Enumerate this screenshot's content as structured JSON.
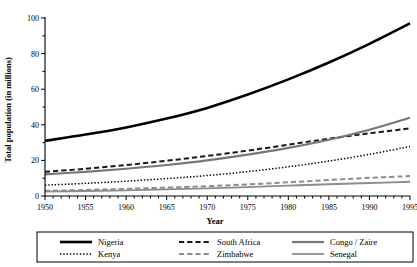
{
  "chart_data": {
    "type": "line",
    "title": "",
    "xlabel": "Year",
    "ylabel": "Total population (in millions)",
    "xlim": [
      1950,
      1995
    ],
    "ylim": [
      0,
      100
    ],
    "xticks": [
      1950,
      1955,
      1960,
      1965,
      1970,
      1975,
      1980,
      1985,
      1990,
      1995
    ],
    "xticklabels": [
      "1950",
      "1955",
      "1960",
      "1965",
      "1970",
      "1975",
      "1980",
      "1985",
      "1990",
      "1995"
    ],
    "x_minor_step": 1,
    "yticks": [
      0,
      20,
      40,
      60,
      80,
      100
    ],
    "yticklabels": [
      "0",
      "20",
      "40",
      "60",
      "80",
      "100"
    ],
    "y_minor_step": 10,
    "grid": false,
    "legend_position": "bottom",
    "legend_columns": 3,
    "x": [
      1950,
      1955,
      1960,
      1965,
      1970,
      1975,
      1980,
      1985,
      1990,
      1995
    ],
    "series": [
      {
        "name": "Nigeria",
        "color": "#000000",
        "style": "solid",
        "width": 2.6,
        "legend_col": 0,
        "legend_row": 0,
        "values": [
          31.0,
          34.5,
          38.5,
          43.5,
          49.5,
          57.0,
          65.5,
          75.0,
          85.5,
          97.0
        ]
      },
      {
        "name": "Kenya",
        "color": "#000000",
        "style": "dotted",
        "width": 1.5,
        "legend_col": 0,
        "legend_row": 1,
        "values": [
          6.1,
          7.1,
          8.3,
          9.8,
          11.5,
          13.7,
          16.4,
          19.6,
          23.4,
          27.8
        ]
      },
      {
        "name": "South Africa",
        "color": "#1a1a1a",
        "style": "dashed",
        "width": 2.0,
        "legend_col": 1,
        "legend_row": 0,
        "values": [
          13.6,
          15.3,
          17.4,
          19.8,
          22.5,
          25.5,
          28.8,
          32.2,
          35.2,
          38.0
        ]
      },
      {
        "name": "Zimbabwe",
        "color": "#8c8c8c",
        "style": "dashed",
        "width": 2.0,
        "legend_col": 1,
        "legend_row": 1,
        "values": [
          2.9,
          3.4,
          4.0,
          4.7,
          5.5,
          6.5,
          7.7,
          9.0,
          10.2,
          11.2
        ]
      },
      {
        "name": "Congo / Zaire",
        "color": "#777777",
        "style": "solid",
        "width": 2.2,
        "legend_col": 2,
        "legend_row": 0,
        "values": [
          12.2,
          13.6,
          15.3,
          17.4,
          20.0,
          23.2,
          27.0,
          31.6,
          37.2,
          44.0
        ]
      },
      {
        "name": "Senegal",
        "color": "#8c8c8c",
        "style": "solid",
        "width": 1.8,
        "legend_col": 2,
        "legend_row": 1,
        "values": [
          2.5,
          2.8,
          3.2,
          3.7,
          4.3,
          5.0,
          5.8,
          6.6,
          7.3,
          8.0
        ]
      }
    ]
  }
}
